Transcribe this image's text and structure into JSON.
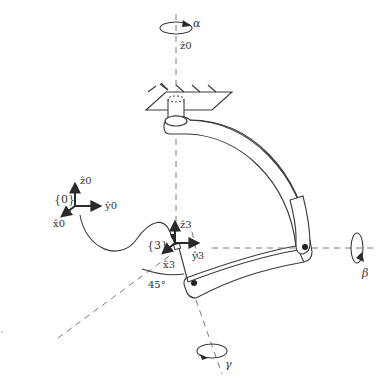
{
  "diagram": {
    "type": "mechanism-schematic",
    "rotation_axes": [
      {
        "id": "alpha",
        "symbol": "α",
        "axis_label": "ẑ0",
        "direction": "vertical"
      },
      {
        "id": "beta",
        "symbol": "β",
        "direction": "horizontal-right"
      },
      {
        "id": "gamma",
        "symbol": "γ",
        "direction": "downward-diagonal"
      }
    ],
    "frames": [
      {
        "id": "frame0",
        "label": "{0}",
        "axes": {
          "z": "ẑ0",
          "y": "ŷ0",
          "x": "x̂0"
        }
      },
      {
        "id": "frame3",
        "label": "{3}",
        "axes": {
          "z": "ẑ3",
          "y": "ŷ3",
          "x": "x̂3"
        }
      }
    ],
    "angle_annotation": "45°",
    "colors": {
      "line": "#3a3a3a",
      "dashed": "#7a7a7a",
      "text": "#333333",
      "background": "#ffffff"
    }
  },
  "labels": {
    "alpha": "α",
    "beta": "β",
    "gamma": "γ",
    "z0_top": "ẑ0",
    "frame0": "{0}",
    "z0": "ẑ0",
    "y0": "ŷ0",
    "x0": "x̂0",
    "frame3": "{3}",
    "z3": "ẑ3",
    "y3": "ŷ3",
    "x3": "x̂3",
    "angle": "45°"
  }
}
